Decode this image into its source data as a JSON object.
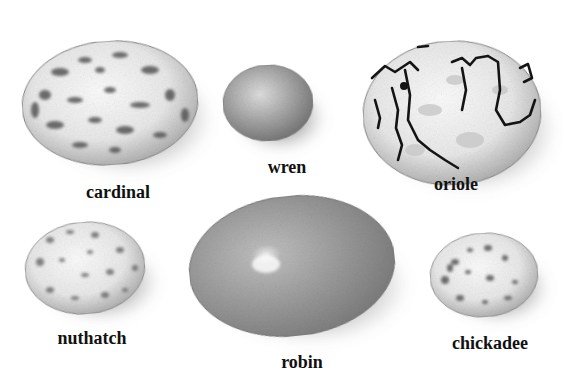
{
  "figure": {
    "background": "#ffffff",
    "style": "grayscale pencil illustration",
    "eggs": [
      {
        "id": "cardinal",
        "label": "cardinal",
        "pattern": "blotched",
        "cx": 110,
        "cy": 103,
        "rx": 88,
        "ry": 62,
        "rot": -4,
        "label_x": 118,
        "label_y": 183
      },
      {
        "id": "wren",
        "label": "wren",
        "pattern": "fine-speckled",
        "cx": 268,
        "cy": 103,
        "rx": 45,
        "ry": 38,
        "rot": -3,
        "label_x": 287,
        "label_y": 158
      },
      {
        "id": "oriole",
        "label": "oriole",
        "pattern": "scrawled-lines",
        "cx": 452,
        "cy": 113,
        "rx": 89,
        "ry": 72,
        "rot": -3,
        "label_x": 456,
        "label_y": 175
      },
      {
        "id": "nuthatch",
        "label": "nuthatch",
        "pattern": "speckled",
        "cx": 85,
        "cy": 268,
        "rx": 60,
        "ry": 46,
        "rot": -5,
        "label_x": 92,
        "label_y": 329
      },
      {
        "id": "robin",
        "label": "robin",
        "pattern": "plain",
        "cx": 292,
        "cy": 266,
        "rx": 103,
        "ry": 70,
        "rot": -6,
        "label_x": 302,
        "label_y": 353
      },
      {
        "id": "chickadee",
        "label": "chickadee",
        "pattern": "spotted",
        "cx": 484,
        "cy": 275,
        "rx": 54,
        "ry": 42,
        "rot": -4,
        "label_x": 490,
        "label_y": 334
      }
    ]
  }
}
